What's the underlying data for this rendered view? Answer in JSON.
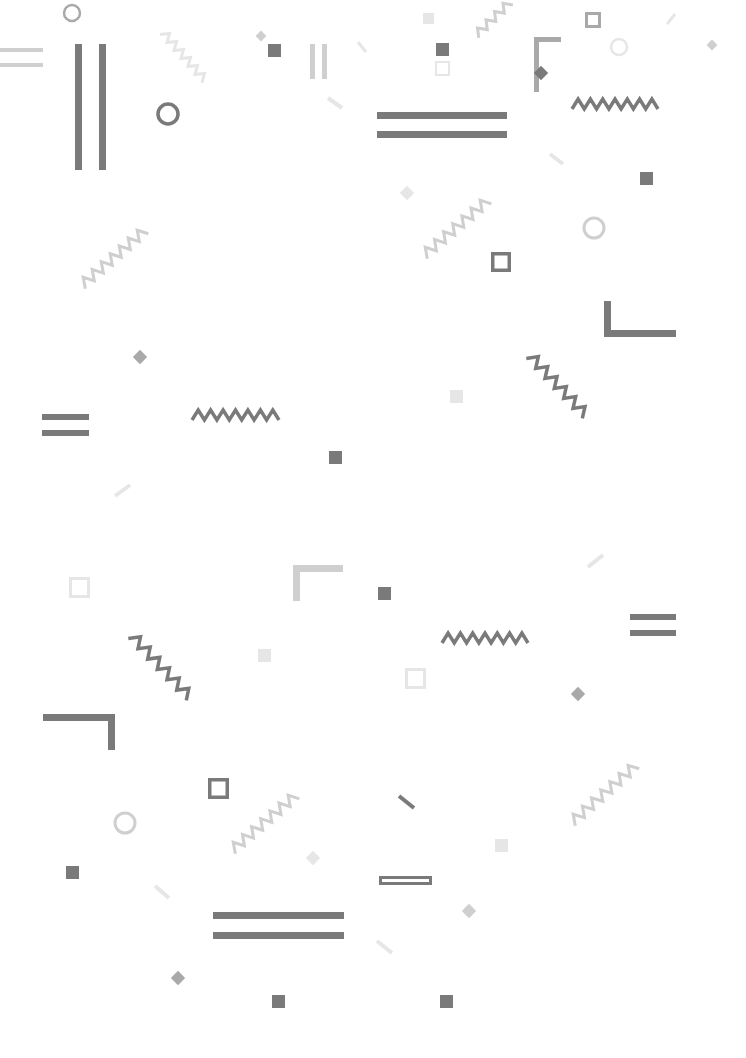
{
  "background": "#ffffff",
  "colors": {
    "dark": "#7a7a7a",
    "mid": "#a9a9a9",
    "light": "#cfcfcf",
    "faint": "#e6e6e6"
  },
  "shapes": [
    {
      "type": "ring",
      "cx": 72,
      "cy": 13,
      "r": 8,
      "sw": 2.5,
      "tone": "mid"
    },
    {
      "type": "bar",
      "x": 0,
      "y": 48,
      "w": 43,
      "h": 4,
      "tone": "light"
    },
    {
      "type": "bar",
      "x": 0,
      "y": 63,
      "w": 43,
      "h": 4,
      "tone": "light"
    },
    {
      "type": "bar",
      "x": 75,
      "y": 44,
      "w": 7,
      "h": 126,
      "tone": "dark"
    },
    {
      "type": "bar",
      "x": 99,
      "y": 44,
      "w": 7,
      "h": 126,
      "tone": "dark"
    },
    {
      "type": "zigzag",
      "x1": 163,
      "y1": 32,
      "x2": 205,
      "y2": 80,
      "n": 6,
      "amp": 4,
      "sw": 3,
      "tone": "faint"
    },
    {
      "type": "ring",
      "cx": 168,
      "cy": 114,
      "r": 10,
      "sw": 3.5,
      "tone": "dark"
    },
    {
      "type": "diamond",
      "cx": 261,
      "cy": 36,
      "s": 9,
      "tone": "light"
    },
    {
      "type": "square",
      "x": 268,
      "y": 44,
      "s": 13,
      "tone": "dark"
    },
    {
      "type": "bar",
      "x": 310,
      "y": 44,
      "w": 5,
      "h": 35,
      "tone": "light"
    },
    {
      "type": "bar",
      "x": 322,
      "y": 44,
      "w": 5,
      "h": 35,
      "tone": "light"
    },
    {
      "type": "dash",
      "x1": 328,
      "y1": 98,
      "x2": 342,
      "y2": 108,
      "sw": 4,
      "tone": "faint"
    },
    {
      "type": "dash",
      "x1": 358,
      "y1": 42,
      "x2": 366,
      "y2": 52,
      "sw": 3,
      "tone": "faint"
    },
    {
      "type": "zigzag",
      "x1": 82,
      "y1": 285,
      "x2": 145,
      "y2": 230,
      "n": 7,
      "amp": 5,
      "sw": 3,
      "tone": "light"
    },
    {
      "type": "square",
      "x": 423,
      "y": 13,
      "s": 11,
      "tone": "faint"
    },
    {
      "type": "zigzag",
      "x1": 476,
      "y1": 35,
      "x2": 510,
      "y2": 2,
      "n": 4,
      "amp": 4,
      "sw": 3,
      "tone": "light"
    },
    {
      "type": "square",
      "x": 436,
      "y": 43,
      "s": 13,
      "tone": "dark"
    },
    {
      "type": "outline",
      "x": 435,
      "y": 61,
      "w": 15,
      "h": 15,
      "sw": 2,
      "tone": "faint"
    },
    {
      "type": "bar",
      "x": 377,
      "y": 112,
      "w": 130,
      "h": 7,
      "tone": "dark"
    },
    {
      "type": "bar",
      "x": 377,
      "y": 131,
      "w": 130,
      "h": 7,
      "tone": "dark"
    },
    {
      "type": "corner",
      "x": 534,
      "y": 37,
      "w": 27,
      "h": 55,
      "t": 5,
      "orient": "tl",
      "tone": "mid"
    },
    {
      "type": "diamond",
      "cx": 541,
      "cy": 73,
      "s": 12,
      "tone": "dark"
    },
    {
      "type": "outline",
      "x": 585,
      "y": 12,
      "w": 16,
      "h": 16,
      "sw": 3,
      "tone": "mid"
    },
    {
      "type": "ring",
      "cx": 619,
      "cy": 47,
      "r": 8,
      "sw": 2.5,
      "tone": "faint"
    },
    {
      "type": "dash",
      "x1": 667,
      "y1": 24,
      "x2": 675,
      "y2": 14,
      "sw": 3,
      "tone": "faint"
    },
    {
      "type": "diamond",
      "cx": 712,
      "cy": 45,
      "s": 9,
      "tone": "light"
    },
    {
      "type": "zigzag",
      "x1": 572,
      "y1": 104,
      "x2": 658,
      "y2": 104,
      "n": 7,
      "amp": 5,
      "sw": 3.5,
      "tone": "dark"
    },
    {
      "type": "dash",
      "x1": 550,
      "y1": 154,
      "x2": 563,
      "y2": 164,
      "sw": 4,
      "tone": "faint"
    },
    {
      "type": "square",
      "x": 640,
      "y": 172,
      "s": 13,
      "tone": "dark"
    },
    {
      "type": "diamond",
      "cx": 407,
      "cy": 193,
      "s": 12,
      "tone": "faint"
    },
    {
      "type": "zigzag",
      "x1": 424,
      "y1": 255,
      "x2": 488,
      "y2": 200,
      "n": 7,
      "amp": 5,
      "sw": 3,
      "tone": "light"
    },
    {
      "type": "outline",
      "x": 491,
      "y": 252,
      "w": 20,
      "h": 20,
      "sw": 3.5,
      "tone": "dark"
    },
    {
      "type": "ring",
      "cx": 594,
      "cy": 228,
      "r": 10,
      "sw": 3,
      "tone": "light"
    },
    {
      "type": "corner",
      "x": 604,
      "y": 301,
      "w": 72,
      "h": 36,
      "t": 7,
      "orient": "bl",
      "tone": "dark"
    },
    {
      "type": "diamond",
      "cx": 140,
      "cy": 357,
      "s": 12,
      "tone": "mid"
    },
    {
      "type": "zigzag",
      "x1": 530,
      "y1": 355,
      "x2": 586,
      "y2": 415,
      "n": 6,
      "amp": 5,
      "sw": 3.5,
      "tone": "dark"
    },
    {
      "type": "bar",
      "x": 42,
      "y": 414,
      "w": 47,
      "h": 6,
      "tone": "dark"
    },
    {
      "type": "bar",
      "x": 42,
      "y": 430,
      "w": 47,
      "h": 6,
      "tone": "dark"
    },
    {
      "type": "zigzag",
      "x1": 192,
      "y1": 415,
      "x2": 279,
      "y2": 415,
      "n": 7,
      "amp": 5,
      "sw": 3.5,
      "tone": "dark"
    },
    {
      "type": "square",
      "x": 450,
      "y": 390,
      "s": 13,
      "tone": "faint"
    },
    {
      "type": "square",
      "x": 329,
      "y": 451,
      "s": 13,
      "tone": "dark"
    },
    {
      "type": "dash",
      "x1": 115,
      "y1": 496,
      "x2": 130,
      "y2": 485,
      "sw": 4,
      "tone": "faint"
    },
    {
      "type": "outline",
      "x": 69,
      "y": 577,
      "w": 21,
      "h": 21,
      "sw": 3,
      "tone": "faint"
    },
    {
      "type": "corner",
      "x": 293,
      "y": 565,
      "w": 50,
      "h": 36,
      "t": 7,
      "orient": "tl",
      "tone": "light"
    },
    {
      "type": "square",
      "x": 378,
      "y": 587,
      "s": 13,
      "tone": "dark"
    },
    {
      "type": "dash",
      "x1": 588,
      "y1": 567,
      "x2": 603,
      "y2": 555,
      "sw": 4,
      "tone": "faint"
    },
    {
      "type": "zigzag",
      "x1": 132,
      "y1": 635,
      "x2": 190,
      "y2": 697,
      "n": 6,
      "amp": 5,
      "sw": 3.5,
      "tone": "dark"
    },
    {
      "type": "square",
      "x": 258,
      "y": 649,
      "s": 13,
      "tone": "faint"
    },
    {
      "type": "zigzag",
      "x1": 442,
      "y1": 638,
      "x2": 528,
      "y2": 638,
      "n": 7,
      "amp": 5,
      "sw": 3.5,
      "tone": "dark"
    },
    {
      "type": "bar",
      "x": 630,
      "y": 614,
      "w": 46,
      "h": 6,
      "tone": "dark"
    },
    {
      "type": "bar",
      "x": 630,
      "y": 630,
      "w": 46,
      "h": 6,
      "tone": "dark"
    },
    {
      "type": "outline",
      "x": 405,
      "y": 668,
      "w": 21,
      "h": 21,
      "sw": 3,
      "tone": "faint"
    },
    {
      "type": "diamond",
      "cx": 578,
      "cy": 694,
      "s": 12,
      "tone": "mid"
    },
    {
      "type": "corner",
      "x": 43,
      "y": 714,
      "w": 72,
      "h": 36,
      "t": 7,
      "orient": "tr",
      "tone": "dark"
    },
    {
      "type": "outline",
      "x": 208,
      "y": 778,
      "w": 21,
      "h": 21,
      "sw": 3.5,
      "tone": "dark"
    },
    {
      "type": "zigzag",
      "x1": 572,
      "y1": 822,
      "x2": 636,
      "y2": 765,
      "n": 7,
      "amp": 5,
      "sw": 3,
      "tone": "light"
    },
    {
      "type": "zigzag",
      "x1": 232,
      "y1": 850,
      "x2": 296,
      "y2": 795,
      "n": 7,
      "amp": 5,
      "sw": 3,
      "tone": "light"
    },
    {
      "type": "ring",
      "cx": 125,
      "cy": 823,
      "r": 10,
      "sw": 3,
      "tone": "light"
    },
    {
      "type": "dash",
      "x1": 399,
      "y1": 796,
      "x2": 414,
      "y2": 808,
      "sw": 4,
      "tone": "dark"
    },
    {
      "type": "square",
      "x": 495,
      "y": 839,
      "s": 13,
      "tone": "faint"
    },
    {
      "type": "diamond",
      "cx": 313,
      "cy": 858,
      "s": 12,
      "tone": "faint"
    },
    {
      "type": "square",
      "x": 66,
      "y": 866,
      "s": 13,
      "tone": "dark"
    },
    {
      "type": "outline",
      "x": 379,
      "y": 876,
      "w": 53,
      "h": 9,
      "sw": 3,
      "tone": "dark"
    },
    {
      "type": "dash",
      "x1": 155,
      "y1": 886,
      "x2": 169,
      "y2": 898,
      "sw": 4,
      "tone": "faint"
    },
    {
      "type": "diamond",
      "cx": 469,
      "cy": 911,
      "s": 12,
      "tone": "light"
    },
    {
      "type": "bar",
      "x": 213,
      "y": 912,
      "w": 131,
      "h": 7,
      "tone": "dark"
    },
    {
      "type": "bar",
      "x": 213,
      "y": 932,
      "w": 131,
      "h": 7,
      "tone": "dark"
    },
    {
      "type": "dash",
      "x1": 377,
      "y1": 941,
      "x2": 392,
      "y2": 953,
      "sw": 4,
      "tone": "faint"
    },
    {
      "type": "diamond",
      "cx": 178,
      "cy": 978,
      "s": 12,
      "tone": "mid"
    },
    {
      "type": "square",
      "x": 272,
      "y": 995,
      "s": 13,
      "tone": "dark"
    },
    {
      "type": "square",
      "x": 440,
      "y": 995,
      "s": 13,
      "tone": "dark"
    }
  ]
}
